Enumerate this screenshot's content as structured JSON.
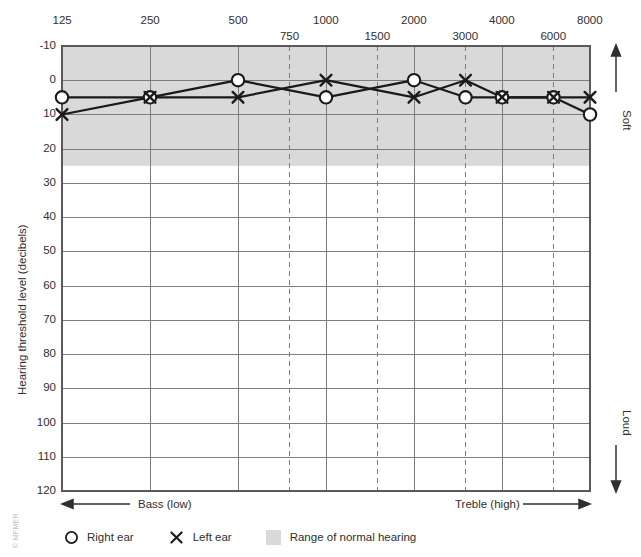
{
  "chart_data": {
    "type": "line",
    "title": "",
    "xlabel": "",
    "ylabel": "Hearing threshold level (decibels)",
    "x_axis_position": "top",
    "y_inverted": true,
    "ylim": [
      -10,
      120
    ],
    "y_ticks": [
      -10,
      0,
      10,
      20,
      30,
      40,
      50,
      60,
      70,
      80,
      90,
      100,
      110,
      120
    ],
    "x_major_ticks": [
      125,
      250,
      500,
      1000,
      2000,
      4000,
      8000
    ],
    "x_minor_ticks": [
      750,
      1500,
      3000,
      6000
    ],
    "x_tick_labels_upper": [
      "125",
      "250",
      "500",
      "1000",
      "2000",
      "4000",
      "8000"
    ],
    "x_tick_labels_lower": [
      "750",
      "1500",
      "3000",
      "6000"
    ],
    "grid": true,
    "legend_position": "below",
    "normal_range": {
      "from": -10,
      "to": 25,
      "color": "#d9d9d9",
      "label": "Range of normal hearing"
    },
    "series": [
      {
        "name": "Right ear",
        "marker": "circle",
        "x": [
          125,
          250,
          500,
          1000,
          2000,
          3000,
          4000,
          6000,
          8000
        ],
        "values": [
          5,
          5,
          0,
          5,
          0,
          5,
          5,
          5,
          10
        ]
      },
      {
        "name": "Left ear",
        "marker": "x",
        "x": [
          125,
          250,
          500,
          1000,
          2000,
          3000,
          4000,
          6000,
          8000
        ],
        "values": [
          10,
          5,
          5,
          0,
          5,
          0,
          5,
          5,
          5
        ]
      }
    ],
    "annotations": {
      "top_right": "Soft",
      "bottom_right": "Loud",
      "bottom_left": "Bass (low)",
      "bottom_right_axis": "Treble (high)"
    }
  },
  "axes": {
    "y_title": "Hearing threshold level (decibels)",
    "y_tick_labels": [
      "-10",
      "0",
      "10",
      "20",
      "30",
      "40",
      "50",
      "60",
      "70",
      "80",
      "90",
      "100",
      "110",
      "120"
    ],
    "freq_labels_upper": [
      "125",
      "250",
      "500",
      "1000",
      "2000",
      "4000",
      "8000"
    ],
    "freq_labels_lower": [
      "750",
      "1500",
      "3000",
      "6000"
    ],
    "bass_label": "Bass (low)",
    "treble_label": "Treble (high)",
    "soft_label": "Soft",
    "loud_label": "Loud"
  },
  "legend": {
    "right_ear": "Right ear",
    "left_ear": "Left ear",
    "normal_range": "Range of normal hearing"
  },
  "footer": {
    "copyright": "© MFMER"
  },
  "colors": {
    "plot_line": "#1a1a1a",
    "grid": "#7d7d7d",
    "shade": "#d9d9d9",
    "text": "#2f2f2f",
    "copyright": "#bdbdbd"
  }
}
